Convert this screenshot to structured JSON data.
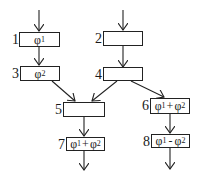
{
  "nodes": [
    {
      "id": "1",
      "label": "1",
      "content": "φ1",
      "content_main": "φ",
      "content_sub": "1"
    },
    {
      "id": "2",
      "label": "2",
      "content": ""
    },
    {
      "id": "3",
      "label": "3",
      "content": "φ2",
      "content_main": "φ",
      "content_sub": "2"
    },
    {
      "id": "4",
      "label": "4",
      "content": ""
    },
    {
      "id": "5",
      "label": "5",
      "content": ""
    },
    {
      "id": "6",
      "label": "6",
      "content": "φ1+φ2",
      "a": "φ",
      "a_sub": "1",
      "op": "+",
      "b": "φ",
      "b_sub": "2"
    },
    {
      "id": "7",
      "label": "7",
      "content": "φ1+φ2",
      "a": "φ",
      "a_sub": "1",
      "op": "+",
      "b": "φ",
      "b_sub": "2"
    },
    {
      "id": "8",
      "label": "8",
      "content": "φ1-φ2",
      "a": "φ",
      "a_sub": "1",
      "op": "-",
      "b": "φ",
      "b_sub": "2"
    }
  ],
  "edges": [
    {
      "from": "entry",
      "to": "1"
    },
    {
      "from": "1",
      "to": "3"
    },
    {
      "from": "3",
      "to": "5"
    },
    {
      "from": "entry",
      "to": "2"
    },
    {
      "from": "2",
      "to": "4"
    },
    {
      "from": "4",
      "to": "5"
    },
    {
      "from": "4",
      "to": "6"
    },
    {
      "from": "5",
      "to": "7"
    },
    {
      "from": "6",
      "to": "8"
    },
    {
      "from": "7",
      "to": "exit"
    },
    {
      "from": "8",
      "to": "exit"
    }
  ]
}
